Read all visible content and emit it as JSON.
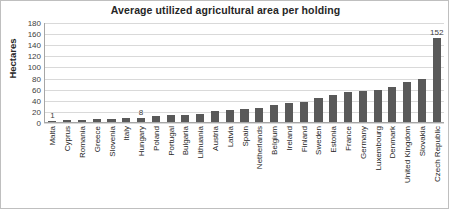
{
  "chart_data": {
    "type": "bar",
    "title": "Average utilized agricultural area per holding",
    "xlabel": "",
    "ylabel": "Hectares",
    "ylim": [
      0,
      180
    ],
    "yticks": [
      0,
      20,
      40,
      60,
      80,
      100,
      120,
      140,
      160,
      180
    ],
    "grid": true,
    "legend": "none",
    "bar_color": "#595959",
    "gridline_color": "#d9d9d9",
    "categories": [
      "Malta",
      "Cyprus",
      "Romania",
      "Greece",
      "Slovenia",
      "Italy",
      "Hungary",
      "Poland",
      "Portugal",
      "Bulgaria",
      "Lithuania",
      "Austria",
      "Latvia",
      "Spain",
      "Netherlands",
      "Belgium",
      "Ireland",
      "Finland",
      "Sweden",
      "Estonia",
      "France",
      "Germany",
      "Luxembourg",
      "Denmark",
      "United Kingdom",
      "Slovakia",
      "Czech Republic"
    ],
    "values": [
      1,
      3,
      3,
      5,
      6,
      8,
      8,
      10,
      12,
      12,
      14,
      19,
      22,
      24,
      26,
      30,
      35,
      36,
      43,
      48,
      54,
      56,
      58,
      63,
      72,
      78,
      152
    ],
    "data_labels": [
      {
        "category": "Malta",
        "value": 1,
        "text": "1"
      },
      {
        "category": "Hungary",
        "value": 8,
        "text": "8"
      },
      {
        "category": "Czech Republic",
        "value": 152,
        "text": "152"
      }
    ]
  }
}
